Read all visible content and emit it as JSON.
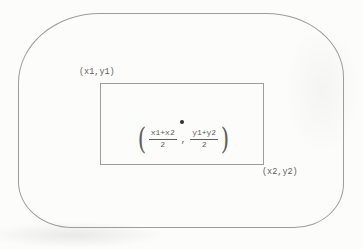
{
  "diagram": {
    "labels": {
      "top_left": "(x1,y1)",
      "bottom_right": "(x2,y2)"
    },
    "formula": {
      "open_paren": "(",
      "frac_x": {
        "numerator": "x1+x2",
        "denominator": "2"
      },
      "separator": ",",
      "frac_y": {
        "numerator": "y1+y2",
        "denominator": "2"
      },
      "close_paren": ")"
    },
    "colors": {
      "background": "#fcfcfb",
      "line": "#9d9d9d",
      "text": "#5e5e5e",
      "dot": "#303030"
    }
  }
}
